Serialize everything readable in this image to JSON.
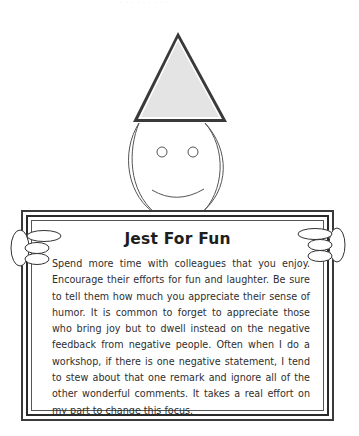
{
  "page": {
    "top_faint_text": "· · · · · · · · ·"
  },
  "illustration": {
    "description": "Smiling stick figure wearing a party hat holding a sign",
    "hat_fill": "#e4e4e4",
    "line_color": "#3a3a3a"
  },
  "sign": {
    "title": "Jest For Fun",
    "body": "Spend more time with colleagues that you enjoy. Encourage their efforts for fun and laughter. Be sure to tell them how much you appreciate their sense of humor. It is common to forget to appreciate those who bring joy but to dwell instead on the negative feedback from negative people. Often when I do a workshop, if there is one negative statement, I tend to stew about that one remark and ignore all of the other wonderful comments. It takes a real effort on my part to change this focus."
  }
}
